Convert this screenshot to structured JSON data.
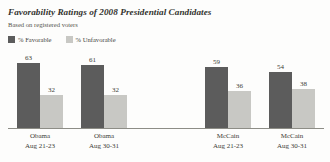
{
  "chart_data": {
    "type": "bar",
    "title": "Favorability Ratings of 2008 Presidential Candidates",
    "subtitle": "Based on registered voters",
    "xlabel": "",
    "ylabel": "",
    "ylim": [
      0,
      70
    ],
    "grid": false,
    "legend_position": "top-left",
    "categories": [
      "Obama Aug 21-23",
      "Obama Aug 30-31",
      "McCain Aug 21-23",
      "McCain Aug 30-31"
    ],
    "series": [
      {
        "name": "% Favorable",
        "color": "#5c5c5c",
        "values": [
          63,
          61,
          59,
          54
        ]
      },
      {
        "name": "% Unfavorable",
        "color": "#c8c8c4",
        "values": [
          32,
          32,
          36,
          38
        ]
      }
    ]
  },
  "header": {
    "title": "Favorability Ratings of 2008 Presidential Candidates",
    "subtitle": "Based on registered voters"
  },
  "legend": {
    "items": [
      {
        "label": "% Favorable",
        "swatch_icon": "square-swatch-dark",
        "color": "#5c5c5c"
      },
      {
        "label": "% Unfavorable",
        "swatch_icon": "square-swatch-light",
        "color": "#c8c8c4"
      }
    ]
  },
  "groups": [
    {
      "candidate": "Obama",
      "date": "Aug 21-23",
      "favorable": 63,
      "unfavorable": 32
    },
    {
      "candidate": "Obama",
      "date": "Aug 30-31",
      "favorable": 61,
      "unfavorable": 32
    },
    {
      "candidate": "McCain",
      "date": "Aug 21-23",
      "favorable": 59,
      "unfavorable": 36
    },
    {
      "candidate": "McCain",
      "date": "Aug 30-31",
      "favorable": 54,
      "unfavorable": 38
    }
  ]
}
